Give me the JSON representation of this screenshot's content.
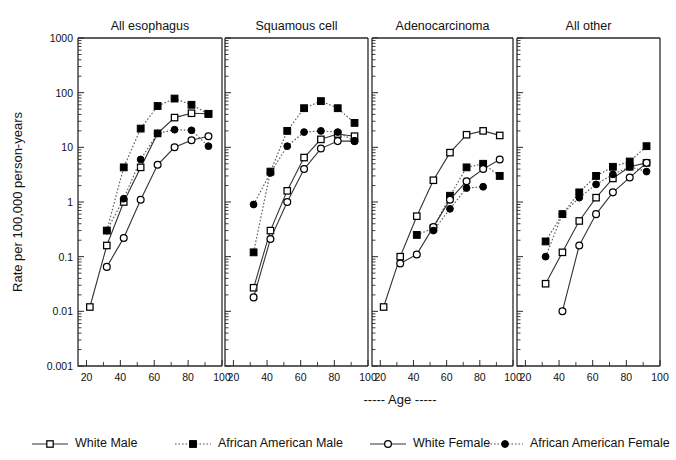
{
  "figure": {
    "ylabel": "Rate per 100,000 person-years",
    "xlabel": "----- Age -----",
    "ytick_labels": [
      "1000",
      "100",
      "10",
      "1",
      "0.1",
      "0.01",
      "0.001"
    ],
    "xtick_labels": [
      "20",
      "40",
      "60",
      "80",
      "100"
    ],
    "colors": {
      "ink": "#000000",
      "axis": "#2a2a2a",
      "background": "#ffffff"
    }
  },
  "legend": {
    "position": "bottom",
    "items": [
      {
        "label": "White Male",
        "marker": "open-square",
        "line": "solid"
      },
      {
        "label": "African American Male",
        "marker": "filled-square",
        "line": "dotted"
      },
      {
        "label": "White Female",
        "marker": "open-circle",
        "line": "solid"
      },
      {
        "label": "African American Female",
        "marker": "filled-circle",
        "line": "dotted"
      }
    ]
  },
  "chart_data": {
    "type": "line",
    "title": "",
    "xlabel": "----- Age -----",
    "ylabel": "Rate per 100,000 person-years",
    "yscale": "log",
    "ylim": [
      0.001,
      1000
    ],
    "xlim": [
      15,
      100
    ],
    "grid": false,
    "legend_position": "bottom",
    "panels": [
      {
        "title": "All esophagus",
        "series": [
          {
            "name": "White Male",
            "marker": "open-square",
            "line": "solid",
            "x": [
              22,
              32,
              42,
              52,
              62,
              72,
              82,
              92
            ],
            "y": [
              0.012,
              0.16,
              1.0,
              4.3,
              18.0,
              35.0,
              42.0,
              41.0
            ]
          },
          {
            "name": "African American Male",
            "marker": "filled-square",
            "line": "dotted",
            "x": [
              32,
              42,
              52,
              62,
              72,
              82,
              92
            ],
            "y": [
              0.3,
              4.3,
              22.0,
              57.0,
              78.0,
              60.0,
              41.0
            ]
          },
          {
            "name": "White Female",
            "marker": "open-circle",
            "line": "solid",
            "x": [
              32,
              42,
              52,
              62,
              72,
              82,
              92
            ],
            "y": [
              0.065,
              0.22,
              1.1,
              4.8,
              10.0,
              13.5,
              16.0
            ]
          },
          {
            "name": "African American Female",
            "marker": "filled-circle",
            "line": "dotted",
            "x": [
              32,
              42,
              52,
              62,
              72,
              82,
              92
            ],
            "y": [
              0.3,
              1.15,
              6.0,
              18.0,
              21.0,
              20.5,
              10.5
            ]
          }
        ]
      },
      {
        "title": "Squamous cell",
        "series": [
          {
            "name": "White Male",
            "marker": "open-square",
            "line": "solid",
            "x": [
              32,
              42,
              52,
              62,
              72,
              82,
              92
            ],
            "y": [
              0.027,
              0.3,
              1.6,
              6.5,
              14.0,
              17.5,
              16.0
            ]
          },
          {
            "name": "African American Male",
            "marker": "filled-square",
            "line": "dotted",
            "x": [
              32,
              42,
              52,
              62,
              72,
              82,
              92
            ],
            "y": [
              0.12,
              3.6,
              20.0,
              52.0,
              70.0,
              52.0,
              28.0
            ]
          },
          {
            "name": "White Female",
            "marker": "open-circle",
            "line": "solid",
            "x": [
              32,
              42,
              52,
              62,
              72,
              82,
              92
            ],
            "y": [
              0.018,
              0.21,
              1.0,
              4.0,
              9.5,
              13.0,
              13.0
            ]
          },
          {
            "name": "African American Female",
            "marker": "filled-circle",
            "line": "dotted",
            "x": [
              32,
              42,
              52,
              62,
              72,
              82,
              92
            ],
            "y": [
              0.9,
              3.4,
              10.5,
              19.0,
              20.0,
              19.0,
              13.0
            ]
          }
        ]
      },
      {
        "title": "Adenocarcinoma",
        "series": [
          {
            "name": "White Male",
            "marker": "open-square",
            "line": "solid",
            "x": [
              22,
              32,
              42,
              52,
              62,
              72,
              82,
              92
            ],
            "y": [
              0.012,
              0.1,
              0.55,
              2.5,
              8.0,
              17.0,
              20.0,
              16.5
            ]
          },
          {
            "name": "African American Male",
            "marker": "filled-square",
            "line": "dotted",
            "x": [
              42,
              52,
              62,
              72,
              82,
              92
            ],
            "y": [
              0.25,
              0.33,
              1.3,
              4.3,
              5.0,
              3.0
            ]
          },
          {
            "name": "White Female",
            "marker": "open-circle",
            "line": "solid",
            "x": [
              32,
              42,
              52,
              62,
              72,
              82,
              92
            ],
            "y": [
              0.075,
              0.11,
              0.35,
              1.1,
              2.4,
              4.0,
              6.0
            ]
          },
          {
            "name": "African American Female",
            "marker": "filled-circle",
            "line": "dotted",
            "x": [
              52,
              62,
              72,
              82
            ],
            "y": [
              0.3,
              0.75,
              1.8,
              1.9
            ]
          }
        ]
      },
      {
        "title": "All other",
        "series": [
          {
            "name": "White Male",
            "marker": "open-square",
            "line": "solid",
            "x": [
              32,
              42,
              52,
              62,
              72,
              82,
              92
            ],
            "y": [
              0.032,
              0.12,
              0.45,
              1.2,
              2.7,
              4.4,
              5.2
            ]
          },
          {
            "name": "African American Male",
            "marker": "filled-square",
            "line": "dotted",
            "x": [
              32,
              42,
              52,
              62,
              72,
              82,
              92
            ],
            "y": [
              0.19,
              0.6,
              1.5,
              3.0,
              4.4,
              5.5,
              10.5
            ]
          },
          {
            "name": "White Female",
            "marker": "open-circle",
            "line": "solid",
            "x": [
              42,
              52,
              62,
              72,
              82,
              92
            ],
            "y": [
              0.01,
              0.16,
              0.6,
              1.5,
              2.8,
              5.2
            ]
          },
          {
            "name": "African American Female",
            "marker": "filled-circle",
            "line": "dotted",
            "x": [
              32,
              42,
              52,
              62,
              72,
              82,
              92
            ],
            "y": [
              0.1,
              0.6,
              1.2,
              2.1,
              3.2,
              4.4,
              3.6
            ]
          }
        ]
      }
    ]
  }
}
